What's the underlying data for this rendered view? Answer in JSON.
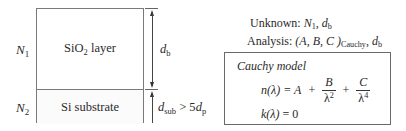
{
  "diagram": {
    "layers": [
      {
        "index_label": "N",
        "index_sub": "1",
        "name_main": "SiO",
        "name_sub": "2",
        "name_rest": " layer"
      },
      {
        "index_label": "N",
        "index_sub": "2",
        "name_main": "Si substrate"
      }
    ],
    "dimensions": {
      "film_thickness": {
        "var": "d",
        "sub": "b"
      },
      "substrate": {
        "var": "d",
        "sub": "sub",
        "relation": " > 5",
        "var2": "d",
        "sub2": "p"
      }
    }
  },
  "info": {
    "unknown_label": "Unknown: ",
    "unknown_vars": [
      {
        "var": "N",
        "sub": "1"
      },
      {
        "var": "d",
        "sub": "b"
      }
    ],
    "analysis_label": "Analysis: ",
    "analysis_params": "(A, B, C )",
    "analysis_params_sub": "Cauchy",
    "analysis_extra": {
      "var": "d",
      "sub": "b"
    }
  },
  "model": {
    "title": "Cauchy model",
    "n_lhs": "n(λ) = A",
    "plus": "+",
    "term_b": {
      "num": "B",
      "den": "λ",
      "den_exp": "2"
    },
    "term_c": {
      "num": "C",
      "den": "λ",
      "den_exp": "4"
    },
    "k_eq_lhs": "k(λ)",
    "k_eq_rhs": " = 0"
  }
}
